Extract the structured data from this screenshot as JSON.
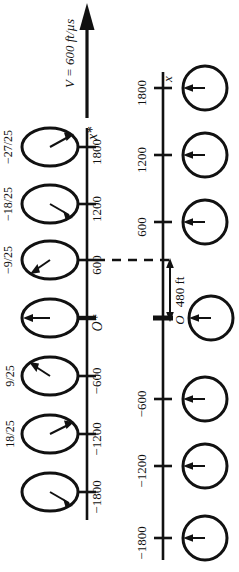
{
  "figure": {
    "orientation": "rotated-90-ccw",
    "background_color": "#ffffff",
    "ink_color": "#111111",
    "velocity_label": "V = 600 ft/µs",
    "separation_label": "480 ft",
    "origin_label_primed": "O*",
    "origin_label_unprimed": "O",
    "axis_label_primed": "x*",
    "axis_label_unprimed": "x"
  },
  "primed_axis": {
    "name": "x*",
    "label": "x*",
    "ticks": [
      {
        "value": 1800,
        "label": "1800",
        "clock_hand": "upper-right",
        "fraction": "−27/25"
      },
      {
        "value": 1200,
        "label": "1200",
        "clock_hand": "lower-right",
        "fraction": "−18/25"
      },
      {
        "value": 600,
        "label": "600",
        "clock_hand": "lower-left",
        "fraction": "−9/25"
      },
      {
        "value": 0,
        "label": "O*",
        "clock_hand": "left",
        "fraction": ""
      },
      {
        "value": -600,
        "label": "−600",
        "clock_hand": "upper-left",
        "fraction": "9/25"
      },
      {
        "value": -1200,
        "label": "−1200",
        "clock_hand": "upper-right",
        "fraction": "18/25"
      },
      {
        "value": -1800,
        "label": "−1800",
        "clock_hand": "lower-right",
        "fraction": ""
      }
    ],
    "clock_shape": "ellipse"
  },
  "unprimed_axis": {
    "name": "x",
    "label": "x",
    "ticks": [
      {
        "value": 1800,
        "label": "1800",
        "clock_hand": "left"
      },
      {
        "value": 1200,
        "label": "1200",
        "clock_hand": "left"
      },
      {
        "value": 600,
        "label": "600",
        "clock_hand": "left"
      },
      {
        "value": 0,
        "label": "O",
        "clock_hand": "left"
      },
      {
        "value": -600,
        "label": "−600",
        "clock_hand": "left"
      },
      {
        "value": -1200,
        "label": "−1200",
        "clock_hand": "left"
      },
      {
        "value": -1800,
        "label": "−1800",
        "clock_hand": "left"
      }
    ],
    "clock_shape": "circle"
  },
  "annotations": {
    "dashed_connector": "600 on x* aligns with 480 ft above O on x",
    "arrow_head": "velocity-arrow-up"
  }
}
